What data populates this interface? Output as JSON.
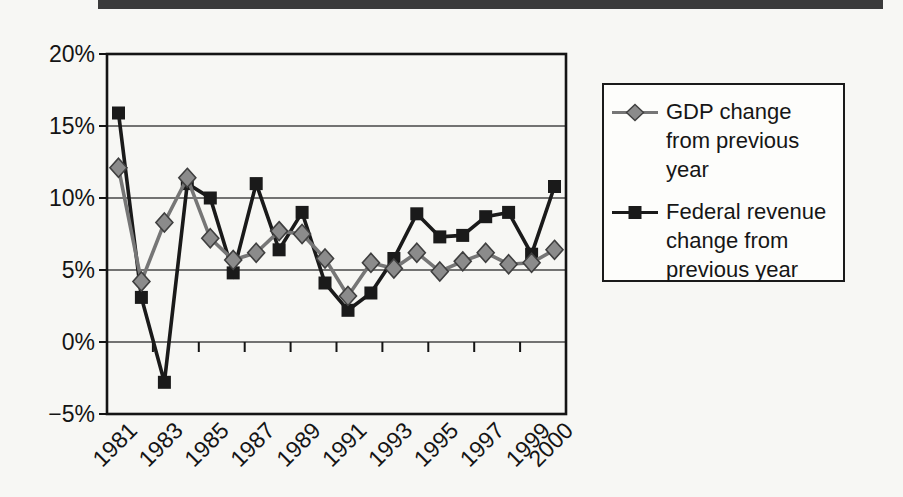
{
  "page": {
    "top_bar_color": "#3b3b3b",
    "background": "#f7f7f4"
  },
  "chart_data": {
    "type": "line",
    "title": "",
    "xlabel": "",
    "ylabel": "",
    "x": [
      1981,
      1982,
      1983,
      1984,
      1985,
      1986,
      1987,
      1988,
      1989,
      1990,
      1991,
      1992,
      1993,
      1994,
      1995,
      1996,
      1997,
      1998,
      1999,
      2000
    ],
    "series": [
      {
        "name": "GDP change from previous year",
        "marker": "diamond",
        "line_color": "#767676",
        "fill": "#8b8b8b",
        "edge": "#3f3f3f",
        "values": [
          12.1,
          4.2,
          8.3,
          11.4,
          7.2,
          5.7,
          6.2,
          7.7,
          7.5,
          5.8,
          3.2,
          5.5,
          5.1,
          6.2,
          4.9,
          5.6,
          6.2,
          5.4,
          5.5,
          6.4
        ]
      },
      {
        "name": "Federal revenue change from previous year",
        "marker": "square",
        "line_color": "#1a1a1a",
        "fill": "#1a1a1a",
        "edge": "#1a1a1a",
        "values": [
          15.9,
          3.1,
          -2.8,
          11.0,
          10.0,
          4.8,
          11.0,
          6.4,
          9.0,
          4.1,
          2.2,
          3.4,
          5.8,
          8.9,
          7.3,
          7.4,
          8.7,
          9.0,
          6.1,
          10.8
        ]
      }
    ],
    "ylim": [
      -5,
      20
    ],
    "ytick_values": [
      20,
      15,
      10,
      5,
      0,
      -5
    ],
    "ytick_labels": [
      "20%",
      "15%",
      "10%",
      "5%",
      "0%",
      "−5%"
    ],
    "xtick_label_indices": [
      0,
      2,
      4,
      6,
      8,
      10,
      12,
      14,
      16,
      18,
      19
    ],
    "xtick_labels": [
      "1981",
      "1983",
      "1985",
      "1987",
      "1989",
      "1991",
      "1993",
      "1995",
      "1997",
      "1999",
      "2000"
    ],
    "grid": true,
    "grid_color": "#474747",
    "axis_color": "#141414",
    "legend_position": "right"
  }
}
